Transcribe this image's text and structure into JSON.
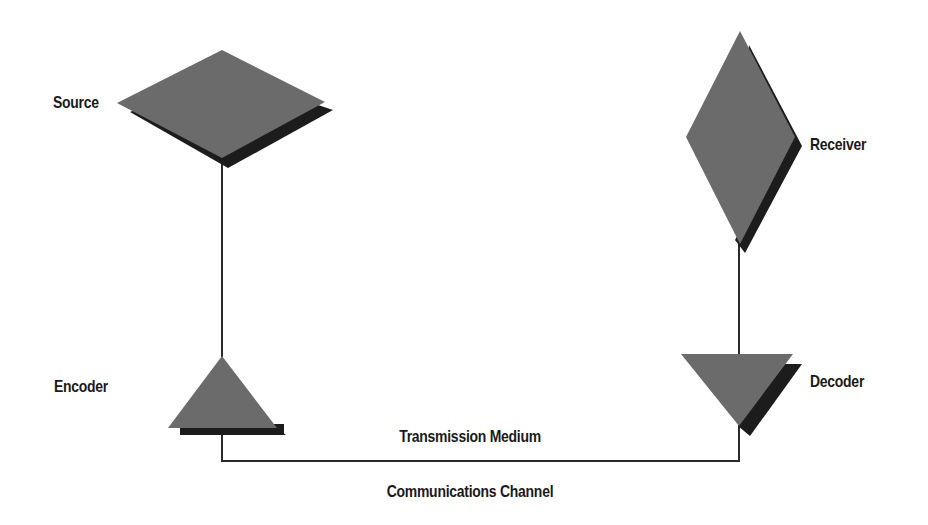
{
  "diagram": {
    "colors": {
      "background": "#ffffff",
      "shape_fill": "#6b6b6b",
      "shape_shadow": "#1c1c1c",
      "connector": "#2a2a2a",
      "text": "#1a1a1a"
    },
    "nodes": [
      {
        "id": "source",
        "label": "Source",
        "shape": "diamond-wide"
      },
      {
        "id": "encoder",
        "label": "Encoder",
        "shape": "triangle-up"
      },
      {
        "id": "decoder",
        "label": "Decoder",
        "shape": "triangle-down"
      },
      {
        "id": "receiver",
        "label": "Receiver",
        "shape": "diamond-tall"
      }
    ],
    "edges": [
      {
        "from": "source",
        "to": "encoder"
      },
      {
        "from": "encoder",
        "to": "decoder",
        "label": "Transmission Medium"
      },
      {
        "from": "decoder",
        "to": "receiver"
      }
    ],
    "labels": {
      "source": "Source",
      "encoder": "Encoder",
      "decoder": "Decoder",
      "receiver": "Receiver",
      "transmission_medium": "Transmission Medium",
      "communications_channel": "Communications Channel"
    }
  }
}
